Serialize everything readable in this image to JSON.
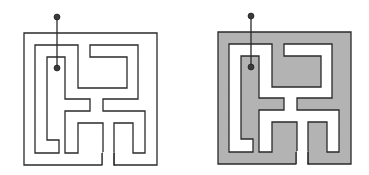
{
  "figure": {
    "colors": {
      "background": "#ffffff",
      "wall_line": "#2a2a2a",
      "wall_fill_right": "#b3b3b3",
      "corridor_fill": "#ffffff",
      "marker": "#3a3a3a"
    },
    "panels": [
      {
        "id": "maze-plain",
        "origin": [
          24,
          33
        ],
        "shaded": false
      },
      {
        "id": "maze-shaded",
        "origin": [
          218,
          32
        ],
        "shaded": true
      }
    ],
    "maze": {
      "outer_size": [
        133,
        132
      ],
      "exit_gap_x": [
        78,
        90
      ],
      "corridor_polygon": [
        [
          11,
          12
        ],
        [
          54,
          12
        ],
        [
          54,
          55
        ],
        [
          103,
          55
        ],
        [
          103,
          24
        ],
        [
          66,
          24
        ],
        [
          66,
          12
        ],
        [
          114,
          12
        ],
        [
          114,
          66
        ],
        [
          79,
          66
        ],
        [
          79,
          78
        ],
        [
          121,
          78
        ],
        [
          121,
          120
        ],
        [
          109,
          120
        ],
        [
          109,
          90
        ],
        [
          90,
          90
        ],
        [
          90,
          132
        ],
        [
          79,
          132
        ],
        [
          79,
          90
        ],
        [
          54,
          90
        ],
        [
          54,
          120
        ],
        [
          41,
          120
        ],
        [
          41,
          78
        ],
        [
          66,
          78
        ],
        [
          66,
          66
        ],
        [
          41,
          66
        ],
        [
          41,
          24
        ],
        [
          23,
          24
        ],
        [
          23,
          107
        ],
        [
          35,
          107
        ],
        [
          35,
          120
        ],
        [
          11,
          120
        ]
      ],
      "marker_outside": [
        33,
        -16
      ],
      "marker_inside": [
        33,
        35
      ],
      "marker_radius": 3
    }
  }
}
